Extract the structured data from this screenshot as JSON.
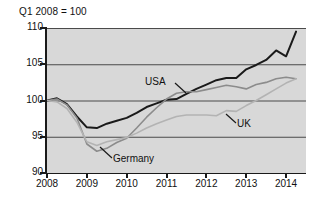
{
  "figure": {
    "caption": "Q1 2008 = 100",
    "background": "#ffffff",
    "plot_background": "#d8d8d8"
  },
  "chart_data": {
    "type": "line",
    "title": "",
    "subtitle": "",
    "caption": "Q1 2008 = 100",
    "xlabel": "",
    "ylabel": "",
    "xlim": [
      2008.0,
      2014.5
    ],
    "ylim": [
      90,
      110
    ],
    "grid": true,
    "grid_axis": "y",
    "legend": "inline-annotations",
    "legend_position": "inline",
    "yticks": [
      90,
      95,
      100,
      105,
      110
    ],
    "ytick_labels": [
      "90",
      "95",
      "100",
      "105",
      "110"
    ],
    "xticks": [
      2008,
      2009,
      2010,
      2011,
      2012,
      2013,
      2014
    ],
    "xtick_labels": [
      "2008",
      "2009",
      "2010",
      "2011",
      "2012",
      "2013",
      "2014"
    ],
    "x": [
      2008.0,
      2008.25,
      2008.5,
      2008.75,
      2009.0,
      2009.25,
      2009.5,
      2009.75,
      2010.0,
      2010.25,
      2010.5,
      2010.75,
      2011.0,
      2011.25,
      2011.5,
      2011.75,
      2012.0,
      2012.25,
      2012.5,
      2012.75,
      2013.0,
      2013.25,
      2013.5,
      2013.75,
      2014.0,
      2014.25
    ],
    "series": [
      {
        "name": "USA",
        "label": "USA",
        "color": "#1a1a1a",
        "width": 2.0,
        "values": [
          100.0,
          100.3,
          99.5,
          97.8,
          96.3,
          96.2,
          96.8,
          97.2,
          97.6,
          98.3,
          99.1,
          99.6,
          100.1,
          100.2,
          100.9,
          101.6,
          102.2,
          102.8,
          103.1,
          103.1,
          104.3,
          104.9,
          105.6,
          106.9,
          106.1,
          109.5
        ]
      },
      {
        "name": "Germany",
        "label": "Germany",
        "color": "#8c8c8c",
        "width": 1.6,
        "values": [
          100.0,
          100.2,
          99.4,
          97.6,
          94.0,
          93.0,
          93.4,
          94.2,
          94.8,
          96.2,
          97.7,
          99.0,
          100.2,
          101.0,
          101.2,
          101.2,
          101.5,
          101.8,
          102.1,
          101.9,
          101.6,
          102.2,
          102.5,
          103.0,
          103.2,
          103.0
        ]
      },
      {
        "name": "UK",
        "label": "UK",
        "color": "#b3b3b3",
        "width": 1.6,
        "values": [
          100.0,
          99.8,
          98.9,
          97.0,
          94.3,
          93.8,
          94.3,
          94.6,
          94.9,
          95.5,
          96.2,
          96.8,
          97.3,
          97.8,
          98.0,
          98.0,
          98.0,
          97.9,
          98.6,
          98.5,
          99.3,
          100.0,
          100.8,
          101.6,
          102.4,
          103.0
        ]
      }
    ],
    "annotations": [
      {
        "text": "USA",
        "x": 145,
        "y": 76,
        "leader_to": [
          180,
          93
        ]
      },
      {
        "text": "UK",
        "x": 237,
        "y": 118,
        "leader_to": [
          224,
          110
        ]
      },
      {
        "text": "Germany",
        "x": 113,
        "y": 153,
        "leader_to": [
          97,
          143
        ]
      }
    ]
  }
}
